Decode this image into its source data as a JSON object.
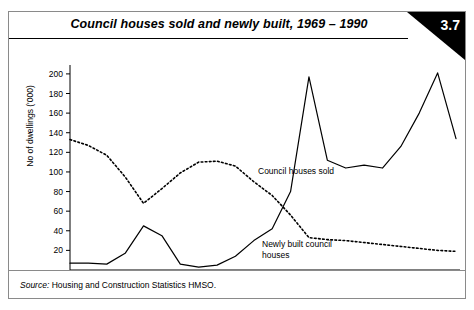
{
  "figure": {
    "title": "Council houses sold and newly built, 1969 – 1990",
    "badge_number": "3.7",
    "source_label": "Source:",
    "source_text": "Housing and Construction Statistics HMSO.",
    "ink_color": "#000000",
    "frame_color": "#8a8a8a",
    "background": "#ffffff"
  },
  "chart_data": {
    "type": "line",
    "title": "Council houses sold and newly built, 1969 – 1990",
    "xlabel": "",
    "ylabel": "No of dwellings ('000)",
    "xlim": [
      1969,
      1990
    ],
    "ylim": [
      0,
      205
    ],
    "grid": false,
    "legend": "inline-annotations",
    "x": [
      1969,
      1970,
      1971,
      1972,
      1973,
      1974,
      1975,
      1976,
      1977,
      1978,
      1979,
      1980,
      1981,
      1982,
      1983,
      1984,
      1985,
      1986,
      1987,
      1988,
      1989,
      1990
    ],
    "ytick_labels": [
      "20",
      "40",
      "60",
      "80",
      "100",
      "120",
      "140",
      "160",
      "180",
      "200"
    ],
    "ytick_values": [
      20,
      40,
      60,
      80,
      100,
      120,
      140,
      160,
      180,
      200
    ],
    "xtick_labels": [
      "1970",
      "1972",
      "1974",
      "1976",
      "1978",
      "1980",
      "1982",
      "1984",
      "1986",
      "1988",
      "1990"
    ],
    "xtick_values": [
      1970,
      1972,
      1974,
      1976,
      1978,
      1980,
      1982,
      1984,
      1986,
      1988,
      1990
    ],
    "series": [
      {
        "name": "Council houses sold",
        "style": "solid",
        "annotation": "Council houses sold",
        "values": [
          7,
          7,
          6,
          17,
          45,
          35,
          6,
          3,
          5,
          14,
          30,
          42,
          80,
          197,
          112,
          104,
          107,
          104,
          126,
          160,
          201,
          134
        ]
      },
      {
        "name": "Newly built council houses",
        "style": "dotted",
        "annotation_line1": "Newly built council",
        "annotation_line2": "houses",
        "values": [
          133,
          127,
          117,
          95,
          68,
          83,
          99,
          110,
          111,
          106,
          90,
          76,
          56,
          33,
          31,
          30,
          28,
          26,
          24,
          22,
          20,
          19
        ]
      }
    ]
  }
}
